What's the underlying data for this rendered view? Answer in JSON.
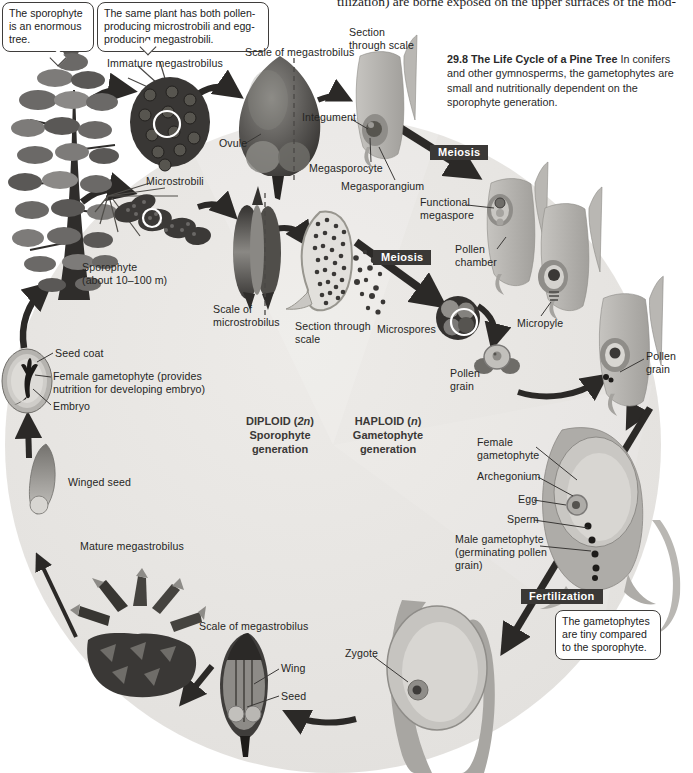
{
  "page": {
    "body_text_fragment": "tilization) are borne exposed on the upper surfaces of the mod-"
  },
  "caption": {
    "number": "29.8",
    "title": "The Life Cycle of a Pine Tree",
    "body": "In conifers and other gymnosperms, the gametophytes are small and nutritionally dependent on the sporophyte generation."
  },
  "callouts": {
    "sporophyte_tree": "The sporophyte is an enormous tree.",
    "same_plant": "The same plant has both pollen-producing microstrobili and egg-producing megastrobili.",
    "gametophytes_tiny": "The gametophytes are tiny compared to the sporophyte."
  },
  "badges": {
    "meiosis_top": "Meiosis",
    "meiosis_mid": "Meiosis",
    "fertilization": "Fertilization"
  },
  "generation": {
    "diploid": {
      "pre": "DIPLOID (",
      "n": "2n",
      "post": ")",
      "line2": "Sporophyte",
      "line3": "generation"
    },
    "haploid": {
      "pre": "HAPLOID (",
      "n": "n",
      "post": ")",
      "line2": "Gametophyte",
      "line3": "generation"
    }
  },
  "labels": {
    "immature_megastrobilus": "Immature megastrobilus",
    "scale_of_megastrobilus_top": "Scale of megastrobilus",
    "section_through_scale_top": "Section\nthrough scale",
    "ovule": "Ovule",
    "integument": "Integument",
    "megasporocyte": "Megasporocyte",
    "megasporangium": "Megasporangium",
    "functional_megaspore": "Functional\nmegaspore",
    "pollen_chamber": "Pollen\nchamber",
    "microstrobili": "Microstrobili",
    "sporophyte": "Sporophyte\n(about 10–100 m)",
    "scale_of_microstrobilus": "Scale of\nmicrostrobilus",
    "section_through_scale_mid": "Section through\nscale",
    "microspores": "Microspores",
    "pollen_grain_left": "Pollen\ngrain",
    "micropyle": "Micropyle",
    "pollen_grain_right": "Pollen\ngrain",
    "seed_coat": "Seed coat",
    "female_gametophyte_left": "Female gametophyte (provides\nnutrition for developing embryo)",
    "embryo": "Embryo",
    "winged_seed": "Winged seed",
    "female_gametophyte_right": "Female\ngametophyte",
    "archegonium": "Archegonium",
    "egg": "Egg",
    "sperm": "Sperm",
    "male_gametophyte": "Male gametophyte\n(germinating pollen\ngrain)",
    "mature_megastrobilus": "Mature megastrobilus",
    "scale_of_megastrobilus_bottom": "Scale of megastrobilus",
    "wing": "Wing",
    "seed": "Seed",
    "zygote": "Zygote"
  },
  "colors": {
    "badge_bg": "#3a3836",
    "circle_bg": "#e7e5e2",
    "arrow": "#2b2927",
    "page_bg": "#ffffff"
  }
}
